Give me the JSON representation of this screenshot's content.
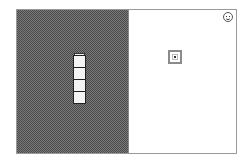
{
  "game": {
    "type": "block-stacking puzzle",
    "left_panel": {
      "pattern": "checkered-dither",
      "color_dark": "#4a4a4a",
      "color_light": "#7a7a7a"
    },
    "right_panel": {
      "background": "#ffffff"
    },
    "stack": {
      "cell_count": 4,
      "has_cap": true,
      "cell_color": "#f4f4f4",
      "border_color": "#222222"
    },
    "target": {
      "outer_color": "#8a8a8a",
      "dot_color": "#333333"
    },
    "status_icon": "smiley-face-icon"
  }
}
